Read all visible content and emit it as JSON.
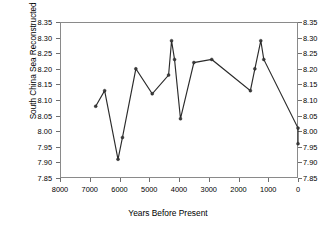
{
  "chart_data": {
    "type": "line",
    "title": "",
    "xlabel": "Years Before Present",
    "ylabel": "South China Sea Reconstructed pH",
    "xlim": [
      8000,
      0
    ],
    "ylim": [
      7.85,
      8.35
    ],
    "x_reversed": true,
    "grid": false,
    "legend": null,
    "xticks": [
      8000,
      7000,
      6000,
      5000,
      4000,
      3000,
      2000,
      1000,
      0
    ],
    "xticklabels": [
      "8000",
      "7000",
      "6000",
      "5000",
      "4000",
      "3000",
      "2000",
      "1000",
      "0"
    ],
    "yticks": [
      7.85,
      7.9,
      7.95,
      8.0,
      8.05,
      8.1,
      8.15,
      8.2,
      8.25,
      8.3,
      8.35
    ],
    "yticklabels": [
      "7.85",
      "7.90",
      "7.95",
      "8.00",
      "8.05",
      "8.10",
      "8.15",
      "8.20",
      "8.25",
      "8.30",
      "8.35"
    ],
    "y_axis_right_mirrored": true,
    "marker": "filled-circle",
    "line_color": "#2b2b2b",
    "x": [
      6800,
      6500,
      6050,
      5900,
      5450,
      4900,
      4350,
      4250,
      4150,
      3950,
      3500,
      2900,
      1600,
      1450,
      1250,
      1150,
      0,
      0
    ],
    "y": [
      8.08,
      8.13,
      7.91,
      7.98,
      8.2,
      8.12,
      8.18,
      8.29,
      8.23,
      8.04,
      8.22,
      8.23,
      8.13,
      8.2,
      8.29,
      8.23,
      8.01,
      7.96
    ]
  },
  "axes": {
    "y_title": "South China Sea Reconstructed pH",
    "x_title": "Years Before Present"
  }
}
